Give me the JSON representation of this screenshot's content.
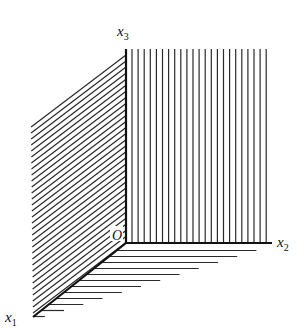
{
  "diagram": {
    "title": "",
    "origin": {
      "label": "O",
      "x": 126,
      "y": 243
    },
    "axes": [
      {
        "name": "x1",
        "label": "x",
        "subscript": "1",
        "end": {
          "x": 33,
          "y": 317
        },
        "label_pos": {
          "x": 5,
          "y": 322
        }
      },
      {
        "name": "x2",
        "label": "x",
        "subscript": "2",
        "end": {
          "x": 272,
          "y": 243
        },
        "label_pos": {
          "x": 277,
          "y": 247
        }
      },
      {
        "name": "x3",
        "label": "x",
        "subscript": "3",
        "end": {
          "x": 126,
          "y": 49
        },
        "label_pos": {
          "x": 117,
          "y": 36
        }
      }
    ],
    "planes": [
      {
        "name": "x1x3-plane",
        "hatch": "diagonal",
        "corners": [
          [
            31,
            121
          ],
          [
            126,
            49
          ],
          [
            126,
            243
          ],
          [
            33,
            317
          ]
        ],
        "spacing": 6
      },
      {
        "name": "x2x3-plane",
        "hatch": "vertical",
        "x_from": 132,
        "x_to": 268,
        "y_top": 49,
        "y_bottom": 243,
        "spacing": 6.1
      },
      {
        "name": "x1x2-plane",
        "hatch": "horizontal",
        "far_edge": [
          [
            258,
            250
          ],
          [
            40,
            318
          ]
        ],
        "spacing": 6
      }
    ],
    "stroke_color": "#2a2a2a",
    "background": "#ffffff"
  }
}
